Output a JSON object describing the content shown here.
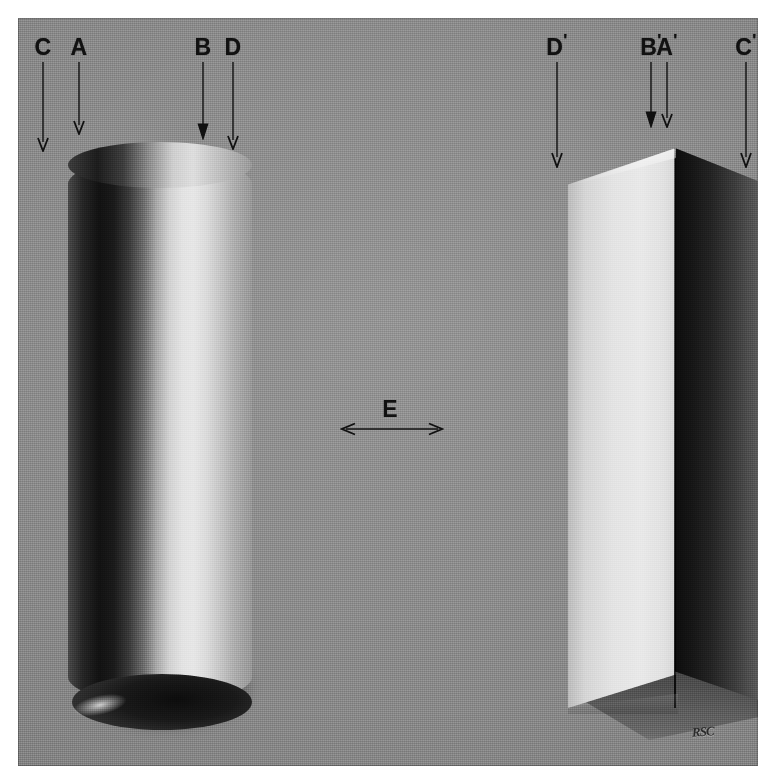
{
  "figure": {
    "background_color": "#8b8b8b",
    "paper_color": "#ffffff",
    "ink_color": "#111111",
    "monogram": "RSC"
  },
  "objects": [
    {
      "name": "cylinder",
      "description": "vertical cylinder, light from the right, dark core shadow on the left"
    },
    {
      "name": "folded-plane",
      "description": "folded card forming a vertical dihedral edge, left face lit, right face in shade"
    }
  ],
  "markers": {
    "left": [
      {
        "id": "C",
        "label": "C",
        "prime": "",
        "x": 43,
        "arrow_top": 62,
        "arrow_bottom": 148
      },
      {
        "id": "A",
        "label": "A",
        "prime": "",
        "x": 79,
        "arrow_top": 62,
        "arrow_bottom": 131
      },
      {
        "id": "B",
        "label": "B",
        "prime": "",
        "x": 203,
        "arrow_top": 62,
        "arrow_bottom": 136
      },
      {
        "id": "D",
        "label": "D",
        "prime": "",
        "x": 233,
        "arrow_top": 62,
        "arrow_bottom": 146
      }
    ],
    "right": [
      {
        "id": "Dp",
        "label": "D",
        "prime": "'",
        "x": 557,
        "arrow_top": 62,
        "arrow_bottom": 164
      },
      {
        "id": "Bp",
        "label": "B",
        "prime": "'",
        "x": 651,
        "arrow_top": 62,
        "arrow_bottom": 124
      },
      {
        "id": "Ap",
        "label": "A",
        "prime": "'",
        "x": 667,
        "arrow_top": 62,
        "arrow_bottom": 124
      },
      {
        "id": "Cp",
        "label": "C",
        "prime": "'",
        "x": 746,
        "arrow_top": 62,
        "arrow_bottom": 164
      }
    ]
  },
  "span_marker": {
    "label": "E",
    "label_x": 390,
    "label_y": 398,
    "arrow_y": 428,
    "arrow_left": 342,
    "arrow_right": 440
  }
}
